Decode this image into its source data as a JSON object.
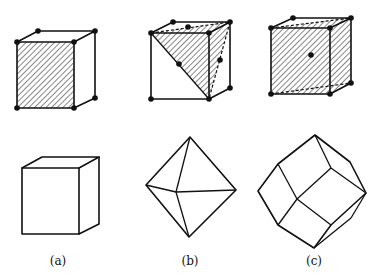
{
  "figure": {
    "panels": [
      {
        "id": "a",
        "label": "(a)",
        "lattice": "simple cubic",
        "plane_face": "cube face",
        "crystal_shape": "cube"
      },
      {
        "id": "b",
        "label": "(b)",
        "lattice": "face-centered cubic",
        "plane_face": "octahedral plane",
        "crystal_shape": "octahedron"
      },
      {
        "id": "c",
        "label": "(c)",
        "lattice": "body-centered cubic",
        "plane_face": "dodecahedral plane",
        "crystal_shape": "rhombic dodecahedron"
      }
    ],
    "colors": {
      "line": "#111111",
      "background": "#ffffff"
    }
  }
}
